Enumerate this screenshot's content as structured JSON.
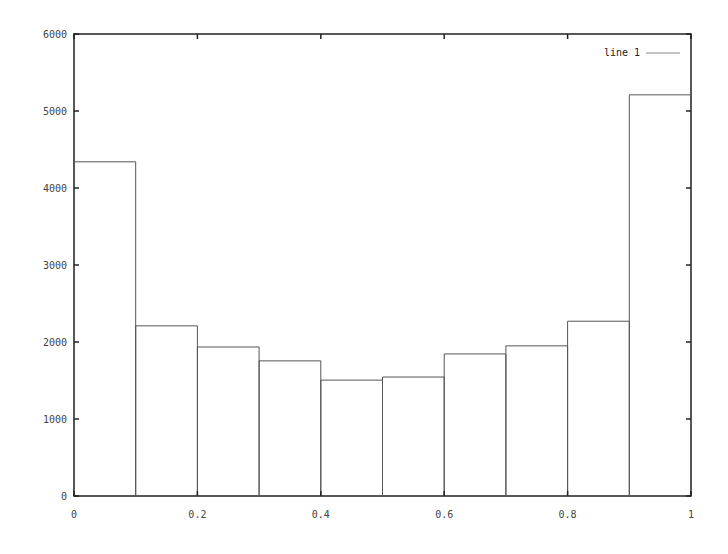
{
  "chart_data": {
    "type": "bar",
    "title": "",
    "xlabel": "",
    "ylabel": "",
    "xlim": [
      0,
      1
    ],
    "ylim": [
      0,
      6000
    ],
    "grid": false,
    "legend_position": "top-right",
    "x_ticks": [
      "0",
      "0.2",
      "0.4",
      "0.6",
      "0.8",
      "1"
    ],
    "y_ticks": [
      "0",
      "1000",
      "2000",
      "3000",
      "4000",
      "5000",
      "6000"
    ],
    "bin_width": 0.1,
    "categories": [
      "0-0.1",
      "0.1-0.2",
      "0.2-0.3",
      "0.3-0.4",
      "0.4-0.5",
      "0.5-0.6",
      "0.6-0.7",
      "0.7-0.8",
      "0.8-0.9",
      "0.9-1.0"
    ],
    "bin_starts": [
      0,
      0.1,
      0.2,
      0.3,
      0.4,
      0.5,
      0.6,
      0.7,
      0.8,
      0.9
    ],
    "series": [
      {
        "name": "line 1",
        "values": [
          4340,
          2210,
          1935,
          1755,
          1505,
          1545,
          1845,
          1950,
          2270,
          5210
        ]
      }
    ]
  },
  "legend": {
    "label": "line 1"
  },
  "colors": {
    "axis": "#222222",
    "bars": "#555555",
    "legend_line": "#888888"
  }
}
